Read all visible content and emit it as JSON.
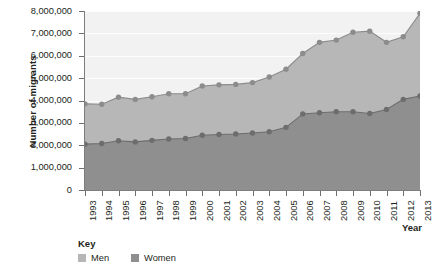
{
  "chart_data": {
    "type": "area",
    "title": "",
    "xlabel": "Year",
    "ylabel": "Number of migrants",
    "x": [
      1993,
      1994,
      1995,
      1996,
      1997,
      1998,
      1999,
      2000,
      2001,
      2002,
      2003,
      2004,
      2005,
      2006,
      2007,
      2008,
      2009,
      2010,
      2011,
      2012,
      2013
    ],
    "categories": [
      "1993",
      "1994",
      "1995",
      "1996",
      "1997",
      "1998",
      "1999",
      "2000",
      "2001",
      "2002",
      "2003",
      "2004",
      "2005",
      "2006",
      "2007",
      "2008",
      "2009",
      "2010",
      "2011",
      "2012",
      "2013"
    ],
    "series": [
      {
        "name": "Men",
        "color": "#b7b7b7",
        "line_color": "#8c8c8c",
        "values": [
          3850000,
          3830000,
          4150000,
          4050000,
          4170000,
          4300000,
          4300000,
          4650000,
          4700000,
          4720000,
          4800000,
          5050000,
          5400000,
          6100000,
          6600000,
          6700000,
          7050000,
          7100000,
          6600000,
          6850000,
          7900000
        ]
      },
      {
        "name": "Women",
        "color": "#8f8f8f",
        "line_color": "#6d6d6d",
        "values": [
          2050000,
          2080000,
          2200000,
          2150000,
          2220000,
          2280000,
          2300000,
          2450000,
          2480000,
          2500000,
          2550000,
          2600000,
          2800000,
          3400000,
          3450000,
          3500000,
          3500000,
          3420000,
          3600000,
          4050000,
          4200000
        ]
      }
    ],
    "ylim": [
      0,
      8000000
    ],
    "y_ticks": [
      "0",
      "1,000,000",
      "2,000,000",
      "3,000,000",
      "4,000,000",
      "5,000,000",
      "6,000,000",
      "7,000,000",
      "8,000,000"
    ],
    "y_tick_values": [
      0,
      1000000,
      2000000,
      3000000,
      4000000,
      5000000,
      6000000,
      7000000,
      8000000
    ],
    "grid": true,
    "legend_position": "bottom-left",
    "plot_background": "#f2f2f2"
  },
  "legend": {
    "title": "Key",
    "items": [
      {
        "label": "Men",
        "color": "#b7b7b7"
      },
      {
        "label": "Women",
        "color": "#8f8f8f"
      }
    ]
  },
  "axis": {
    "x_title": "Year",
    "y_title": "Number of migrants"
  }
}
